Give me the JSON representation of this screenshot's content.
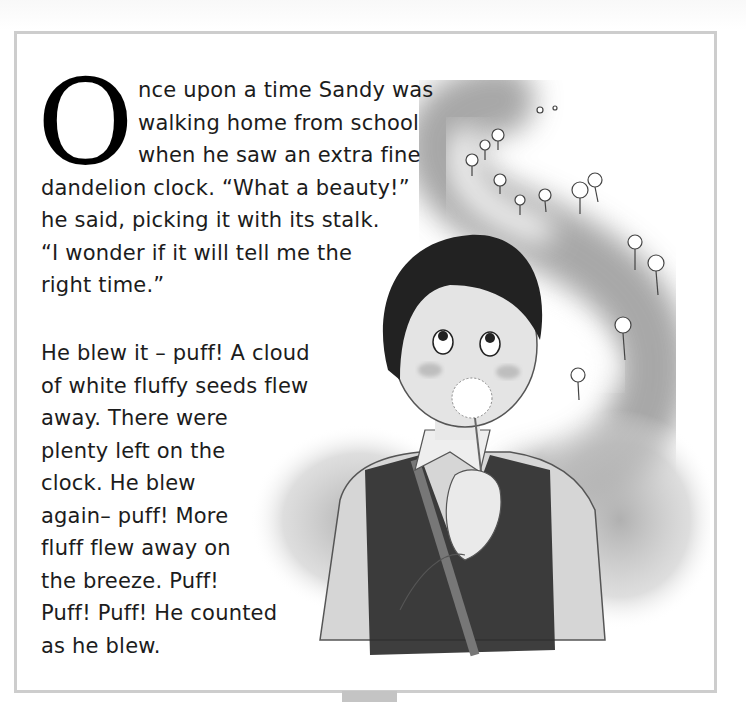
{
  "page": {
    "frame_border_color": "#cdcdcd",
    "tab_color": "#c4c4c4"
  },
  "story": {
    "drop_cap": "O",
    "paragraph1": {
      "lines": [
        "nce upon a time Sandy was",
        "walking home from school",
        "when he saw an extra fine",
        "dandelion clock. “What a beauty!”",
        "he said, picking it with its stalk.",
        "“I wonder if it will tell me the",
        "right time.”"
      ]
    },
    "paragraph2": {
      "lines": [
        "He blew it – puff! A cloud",
        "of white fluffy seeds flew",
        "away. There were",
        "plenty left on the",
        "clock. He blew",
        "again– puff! More",
        "fluff flew away on",
        "the breeze. Puff!",
        "Puff! Puff! He counted",
        "as he blew."
      ]
    }
  },
  "illustration": {
    "subject": "boy blowing a dandelion clock",
    "icon": "dandelion-seeds-illustration"
  }
}
